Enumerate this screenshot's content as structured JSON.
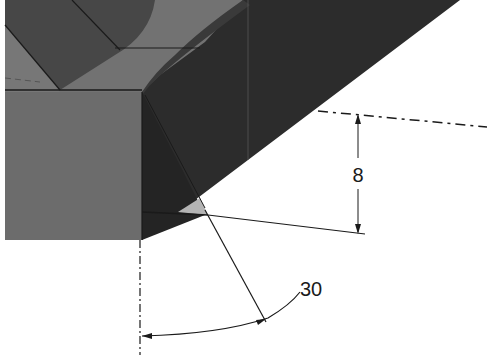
{
  "figure": {
    "type": "cad-chamfer-detail",
    "dimensions": {
      "linear": {
        "value": "8",
        "orientation": "vertical"
      },
      "angular": {
        "value": "30",
        "unit": "degrees"
      }
    },
    "colors": {
      "background": "#ffffff",
      "face_light": "#6e6e6e",
      "face_mid": "#5a5a5a",
      "face_dark": "#3c3c3c",
      "face_darkest": "#242424",
      "chamfer_highlight": "#b4b4b4",
      "lines": "#1a1a1a"
    }
  }
}
